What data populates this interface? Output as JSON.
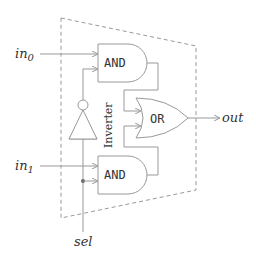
{
  "diagram": {
    "inputs": [
      {
        "name": "in",
        "subscript": "0"
      },
      {
        "name": "in",
        "subscript": "1"
      }
    ],
    "select": "sel",
    "output": "out",
    "gates": {
      "and_top": "AND",
      "and_bottom": "AND",
      "or": "OR",
      "inverter_label": "Inverter"
    },
    "colors": {
      "stroke": "#999999",
      "dashed_border": "#999999",
      "text": "#333333"
    }
  }
}
